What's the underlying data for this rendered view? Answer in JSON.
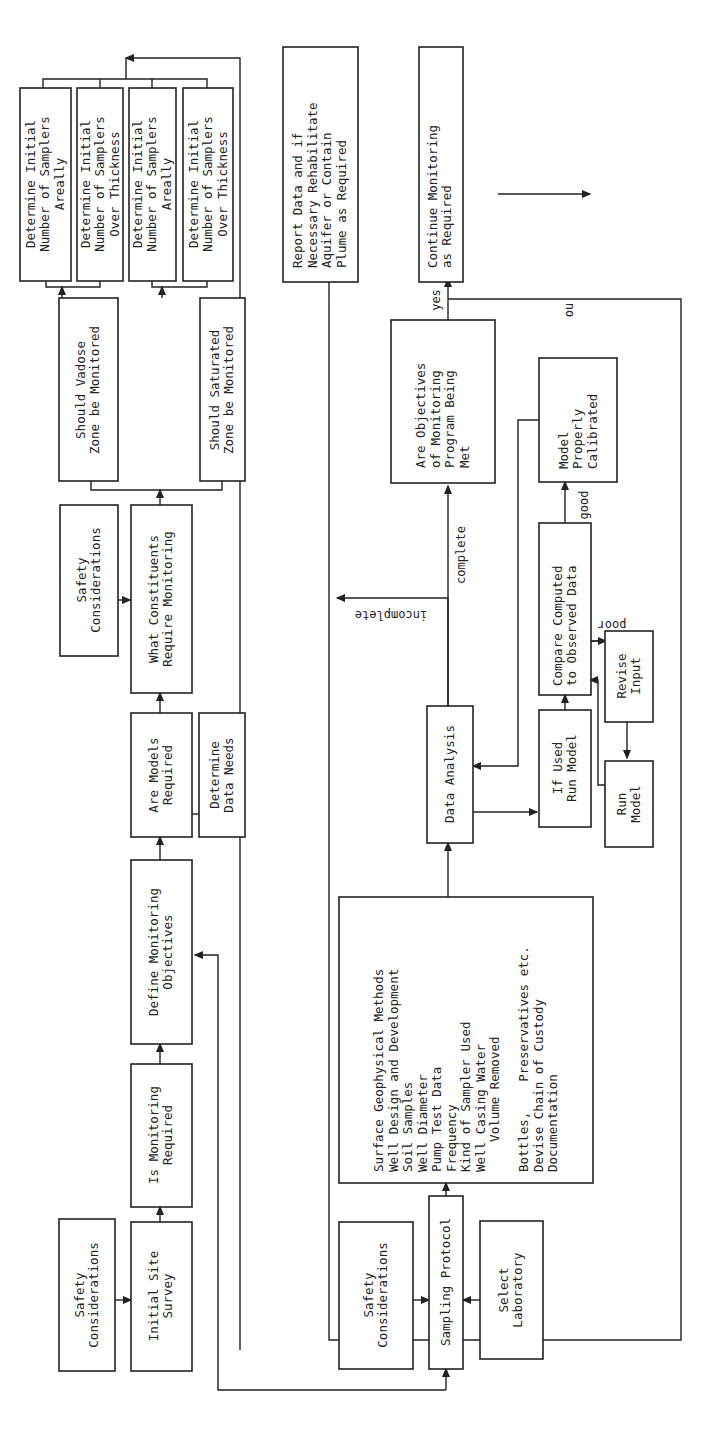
{
  "figure": {
    "header_text": "",
    "nodes": {
      "det_vadose_areal": [
        "Determine Initial",
        "Number of Samplers",
        "Areally"
      ],
      "det_vadose_thick": [
        "Determine Initial",
        "Number of Samplers",
        "Over Thickness"
      ],
      "det_sat_areal": [
        "Determine Initial",
        "Number of Samplers",
        "Areally"
      ],
      "det_sat_thick": [
        "Determine Initial",
        "Number of Samplers",
        "Over Thickness"
      ],
      "vadose": [
        "Should Vadose",
        "Zone be Monitored"
      ],
      "saturated": [
        "Should Saturated",
        "Zone be Monitored"
      ],
      "report": [
        "Report Data and if",
        "Necessary Rehabilitate",
        "Aquifer or Contain",
        "Plume as Required"
      ],
      "continue": [
        "Continue Monitoring",
        "as Required"
      ],
      "safety_top": [
        "Safety",
        "Considerations"
      ],
      "constituents": [
        "What Constituents",
        "Require Monitoring"
      ],
      "objectives_met": [
        "Are Objectives",
        "of Monitoring",
        "Program Being",
        "Met"
      ],
      "calibrated": [
        "Model",
        "Properly",
        "Calibrated"
      ],
      "compare": [
        "Compare Computed",
        "to Observed Data"
      ],
      "revise": [
        "Revise",
        "Input"
      ],
      "run_model": [
        "Run",
        "Model"
      ],
      "if_used": [
        "If Used",
        "Run Model"
      ],
      "data_analysis": [
        "Data Analysis"
      ],
      "models_required": [
        "Are Models",
        "Required"
      ],
      "data_needs": [
        "Determine",
        "Data Needs"
      ],
      "define_objectives": [
        "Define Monitoring",
        "Objectives"
      ],
      "is_monitoring": [
        "Is Monitoring",
        "Required"
      ],
      "site_survey": [
        "Initial Site",
        "Survey"
      ],
      "safety_bottom": [
        "Safety",
        "Considerations"
      ],
      "sampling_protocol": [
        "Sampling Protocol"
      ],
      "safety_protocol": [
        "Safety",
        "Considerations"
      ],
      "select_lab": [
        "Select",
        "Laboratory"
      ],
      "protocol_details": [
        "Surface Geophysical Methods",
        "Well Design and Development",
        "Soil Samples",
        "Well Diameter",
        "Pump Test Data",
        "Frequency",
        "Kind of Sampler Used",
        "Well Casing Water",
        "    Volume Removed",
        "",
        "Bottles,    Preservatives etc.",
        "Devise Chain of Custody",
        "Documentation"
      ]
    },
    "edge_labels": {
      "yes": "yes",
      "no": "no",
      "complete": "complete",
      "incomplete": "incomplete",
      "good": "good",
      "poor": "poor"
    }
  }
}
